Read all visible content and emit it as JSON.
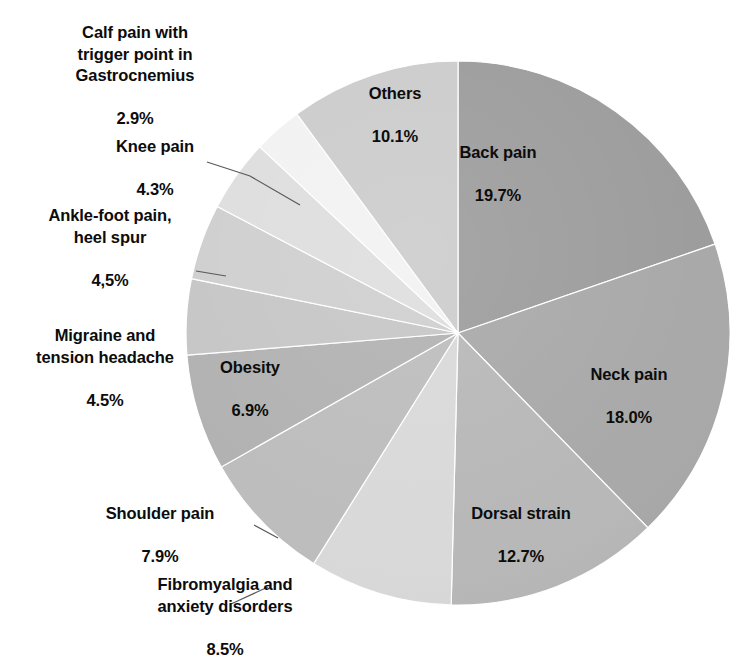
{
  "chart_data": {
    "type": "pie",
    "title": "",
    "subtitle": "",
    "xlabel": "",
    "ylabel": "",
    "legend": "none",
    "grid": false,
    "units": "percent",
    "start_angle_deg": 0,
    "direction": "clockwise",
    "categories": [
      "Back pain",
      "Neck pain",
      "Dorsal strain",
      "Fibromyalgia and\nanxiety disorders",
      "Shoulder pain",
      "Obesity",
      "Migraine and\ntension headache",
      "Ankle-foot pain,\nheel spur",
      "Knee pain",
      "Calf pain with\ntrigger point in\nGastrocnemius",
      "Others"
    ],
    "values": [
      19.7,
      18.0,
      12.7,
      8.5,
      7.9,
      6.9,
      4.5,
      4.5,
      4.3,
      2.9,
      10.1
    ],
    "value_labels": [
      "19.7%",
      "18.0%",
      "12.7%",
      "8.5%",
      "7.9%",
      "6.9%",
      "4.5%",
      "4,5%",
      "4.3%",
      "2.9%",
      "10.1%"
    ],
    "colors": [
      "#9d9d9d",
      "#a9a9a9",
      "#b8b8b8",
      "#d9d9d9",
      "#bdbdbd",
      "#b2b2b2",
      "#c6c6c6",
      "#cfcfcf",
      "#dedede",
      "#f2f2f2",
      "#cccccc"
    ],
    "slices": [
      {
        "name": "Back pain",
        "value": 19.7,
        "value_label": "19.7%",
        "color": "#9d9d9d",
        "label_placement": "inside"
      },
      {
        "name": "Neck pain",
        "value": 18.0,
        "value_label": "18.0%",
        "color": "#a9a9a9",
        "label_placement": "inside"
      },
      {
        "name": "Dorsal strain",
        "value": 12.7,
        "value_label": "12.7%",
        "color": "#b8b8b8",
        "label_placement": "inside"
      },
      {
        "name": "Fibromyalgia and anxiety disorders",
        "value": 8.5,
        "value_label": "8.5%",
        "color": "#d9d9d9",
        "label_placement": "outside"
      },
      {
        "name": "Shoulder pain",
        "value": 7.9,
        "value_label": "7.9%",
        "color": "#bdbdbd",
        "label_placement": "outside"
      },
      {
        "name": "Obesity",
        "value": 6.9,
        "value_label": "6.9%",
        "color": "#b2b2b2",
        "label_placement": "inside"
      },
      {
        "name": "Migraine and tension headache",
        "value": 4.5,
        "value_label": "4.5%",
        "color": "#c6c6c6",
        "label_placement": "outside"
      },
      {
        "name": "Ankle-foot pain, heel spur",
        "value": 4.5,
        "value_label": "4,5%",
        "color": "#cfcfcf",
        "label_placement": "outside"
      },
      {
        "name": "Knee pain",
        "value": 4.3,
        "value_label": "4.3%",
        "color": "#dedede",
        "label_placement": "outside"
      },
      {
        "name": "Calf pain with trigger point in Gastrocnemius",
        "value": 2.9,
        "value_label": "2.9%",
        "color": "#f2f2f2",
        "label_placement": "outside"
      },
      {
        "name": "Others",
        "value": 10.1,
        "value_label": "10.1%",
        "color": "#cccccc",
        "label_placement": "inside"
      }
    ]
  },
  "labels": {
    "back_pain": {
      "name": "Back pain",
      "value": "19.7%"
    },
    "neck_pain": {
      "name": "Neck pain",
      "value": "18.0%"
    },
    "dorsal_strain": {
      "name": "Dorsal strain",
      "value": "12.7%"
    },
    "fibromyalgia": {
      "name": "Fibromyalgia and\nanxiety disorders",
      "value": "8.5%"
    },
    "shoulder_pain": {
      "name": "Shoulder pain",
      "value": "7.9%"
    },
    "obesity": {
      "name": "Obesity",
      "value": "6.9%"
    },
    "migraine": {
      "name": "Migraine and\ntension headache",
      "value": "4.5%"
    },
    "ankle_foot": {
      "name": "Ankle-foot pain,\nheel spur",
      "value": "4,5%"
    },
    "knee_pain": {
      "name": "Knee pain",
      "value": "4.3%"
    },
    "calf_pain": {
      "name": "Calf pain with\ntrigger point in\nGastrocnemius",
      "value": "2.9%"
    },
    "others": {
      "name": "Others",
      "value": "10.1%"
    }
  }
}
